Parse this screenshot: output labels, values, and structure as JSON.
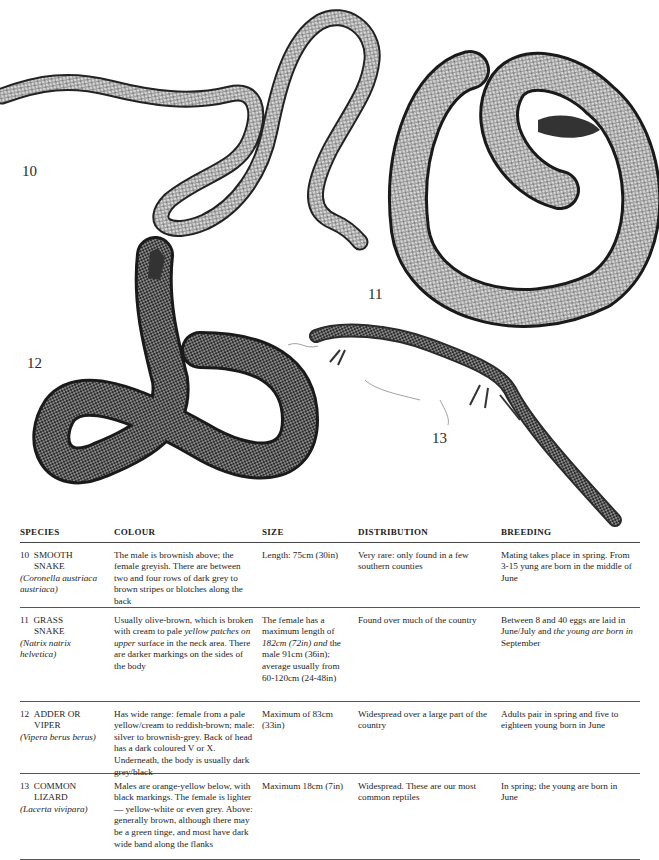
{
  "plate": {
    "figures": [
      {
        "number": "10",
        "subject": "Smooth snake illustration"
      },
      {
        "number": "11",
        "subject": "Grass snake illustration"
      },
      {
        "number": "12",
        "subject": "Adder or viper illustration"
      },
      {
        "number": "13",
        "subject": "Common lizard illustration"
      }
    ]
  },
  "table": {
    "headers": [
      "SPECIES",
      "COLOUR",
      "SIZE",
      "DISTRIBUTION",
      "BREEDING"
    ],
    "rows": [
      {
        "number": "10",
        "name_line1": "SMOOTH",
        "name_line2": "SNAKE",
        "scientific": "(Coronella austriaca austriaca)",
        "colour": "The male is brownish above; the female greyish. There are between two and four rows of dark grey to brown stripes or blotches along the back",
        "size": "Length: 75cm (30in)",
        "distribution": "Very rare: only found in a few southern counties",
        "breeding": "Mating takes place in spring. From 3-15 yung are born in the middle of June"
      },
      {
        "number": "11",
        "name_line1": "GRASS",
        "name_line2": "SNAKE",
        "scientific": "(Natrix natrix helvetica)",
        "colour_a": "Usually olive-brown, which is broken with cream to pale ",
        "colour_b": "yellow patches on upper",
        "colour_c": " surface in the neck area. There are darker markings on the sides of the body",
        "size_a": "The female has a maximum length of ",
        "size_b": "182cm (72in) and",
        "size_c": " the male 91cm (36in); average usually from 60-120cm (24-48in)",
        "distribution": "Found over much of the country",
        "breeding_a": "Between 8 and 40 eggs are laid in June/July and ",
        "breeding_b": "the young are born in",
        "breeding_c": " September"
      },
      {
        "number": "12",
        "name_line1": "ADDER OR",
        "name_line2": "VIPER",
        "scientific": "(Vipera berus berus)",
        "colour": "Has wide range: female from a pale yellow/cream to reddish-brown; male: silver to brownish-grey. Back of head has a dark coloured V or X. Underneath, the body is usually dark grey/black",
        "size": "Maximum of 83cm (33in)",
        "distribution": "Widespread over a large part of the country",
        "breeding": "Adults pair in spring and five to eighteen young born in June"
      },
      {
        "number": "13",
        "name_line1": "COMMON",
        "name_line2": "LIZARD",
        "scientific": "(Lacerta vivipara)",
        "colour": "Males are orange-yellow below, with black markings. The female is lighter — yellow-white or even grey. Above: generally brown, although there may be a green tinge, and most have dark wide band along the flanks",
        "size": "Maximum 18cm (7in)",
        "distribution": "Widespread. These are our most common reptiles",
        "breeding": "In spring; the young are born in June"
      }
    ]
  }
}
